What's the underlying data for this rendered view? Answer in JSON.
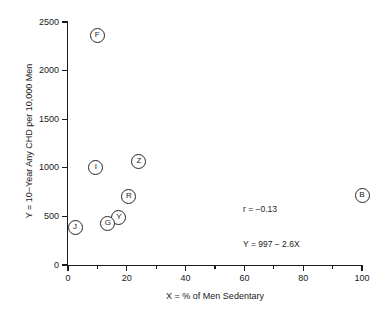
{
  "chart_data": {
    "type": "scatter",
    "title": "",
    "subtitle": "",
    "xlabel": "X = % of Men Sedentary",
    "ylabel": "Y = 10−Year Any CHD per 10,000 Men",
    "xlim": [
      0,
      100
    ],
    "ylim": [
      0,
      2500
    ],
    "grid": false,
    "legend": "none",
    "x_ticks": [
      {
        "value": 0,
        "label": "0",
        "major": true
      },
      {
        "value": 10,
        "label": "",
        "major": false
      },
      {
        "value": 20,
        "label": "20",
        "major": true
      },
      {
        "value": 30,
        "label": "",
        "major": false
      },
      {
        "value": 40,
        "label": "40",
        "major": true
      },
      {
        "value": 50,
        "label": "",
        "major": false
      },
      {
        "value": 60,
        "label": "60",
        "major": true
      },
      {
        "value": 70,
        "label": "",
        "major": false
      },
      {
        "value": 80,
        "label": "80",
        "major": true
      },
      {
        "value": 90,
        "label": "",
        "major": false
      },
      {
        "value": 100,
        "label": "100",
        "major": true
      }
    ],
    "y_ticks": [
      {
        "value": 0,
        "label": "0",
        "major": true
      },
      {
        "value": 500,
        "label": "500",
        "major": true
      },
      {
        "value": 1000,
        "label": "1000",
        "major": true
      },
      {
        "value": 1500,
        "label": "1500",
        "major": true
      },
      {
        "value": 2000,
        "label": "2000",
        "major": true
      },
      {
        "value": 2500,
        "label": "2500",
        "major": true
      }
    ],
    "marker_style": "circled-letter",
    "points": [
      {
        "label": "F",
        "x": 9.9,
        "y": 2366
      },
      {
        "label": "I",
        "x": 9.5,
        "y": 998
      },
      {
        "label": "Z",
        "x": 24.1,
        "y": 1060
      },
      {
        "label": "R",
        "x": 20.7,
        "y": 700
      },
      {
        "label": "Y",
        "x": 17.3,
        "y": 484
      },
      {
        "label": "G",
        "x": 13.6,
        "y": 422
      },
      {
        "label": "J",
        "x": 2.4,
        "y": 381
      },
      {
        "label": "B",
        "x": 100,
        "y": 720
      }
    ],
    "annotations": [
      {
        "name": "correlation",
        "text": "r = −0.13"
      },
      {
        "name": "regression-equation",
        "text": "Y = 997 − 2.6X"
      }
    ],
    "colors": {
      "axis": "#1a1a1a",
      "marker_stroke": "#262626",
      "marker_fill": "#ffffff",
      "background": "#ffffff",
      "text": "#1a1a1a"
    }
  }
}
